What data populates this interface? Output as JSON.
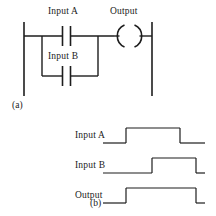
{
  "figure": {
    "type": "ladder-logic-and-timing-diagram",
    "part_a_label": "(a)",
    "part_b_label": "(b)"
  },
  "ladder": {
    "caption": "(a)",
    "rungs": [
      {
        "contacts": [
          {
            "name": "Input A",
            "label": "Input A",
            "kind": "normally-open",
            "branch": "main"
          },
          {
            "name": "Input B",
            "label": "Input B",
            "kind": "normally-open",
            "branch": "parallel"
          }
        ],
        "coil": {
          "name": "Output",
          "label": "Output",
          "kind": "output-coil"
        },
        "logic": "Output = Input A OR Input B"
      }
    ],
    "left_rail": {
      "x": 24,
      "y1": 22,
      "y2": 96
    },
    "right_rail": {
      "x": 152,
      "y1": 22,
      "y2": 96
    },
    "main_branch_y": 36,
    "parallel_branch_y": 76,
    "branch_left_x": 42,
    "branch_right_x": 98,
    "contact_a": {
      "x": 66,
      "y": 36,
      "gap": 7,
      "half_height": 10
    },
    "contact_b": {
      "x": 66,
      "y": 76,
      "gap": 7,
      "half_height": 10
    },
    "coil": {
      "cx": 126,
      "cy": 36,
      "r": 12
    }
  },
  "timing": {
    "caption": "(b)",
    "axis": {
      "start_x": 103,
      "end_x": 205
    },
    "signals": [
      {
        "name": "Input A",
        "label": "Input A",
        "label_x": 75,
        "label_y": 132,
        "baseline_y": 143,
        "high_y": 128,
        "rise_x": 126,
        "fall_x": 180,
        "level_start": 0,
        "level_pulse": 1,
        "level_end": 0
      },
      {
        "name": "Input B",
        "label": "Input B",
        "label_x": 75,
        "label_y": 162,
        "baseline_y": 173,
        "high_y": 158,
        "rise_x": 152,
        "fall_x": 196,
        "level_start": 0,
        "level_pulse": 1,
        "level_end": 0
      },
      {
        "name": "Output",
        "label": "Output",
        "label_x": 75,
        "label_y": 192,
        "baseline_y": 203,
        "high_y": 188,
        "rise_x": 126,
        "fall_x": 196,
        "level_start": 0,
        "level_pulse": 1,
        "level_end": 0
      }
    ]
  },
  "labels": {
    "input_a_ladder": "Input A",
    "input_b_ladder": "Input B",
    "output_ladder": "Output",
    "input_a_timing": "Input A",
    "input_b_timing": "Input B",
    "output_timing": "Output",
    "part_a": "(a)",
    "part_b": "(b)"
  },
  "colors": {
    "line": "#1d1d1d",
    "text": "#1a1a1a",
    "background": "#ffffff"
  }
}
